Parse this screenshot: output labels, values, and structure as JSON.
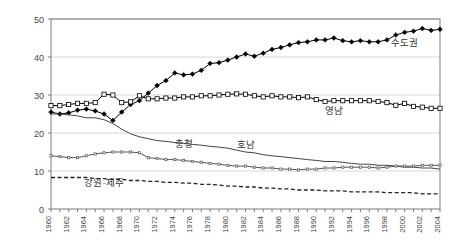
{
  "chart_data": {
    "type": "line",
    "title": "",
    "subtitle": "",
    "xlabel": "",
    "ylabel": "",
    "xlim": [
      1960,
      2004
    ],
    "ylim": [
      0,
      50
    ],
    "yticks": [
      0,
      10,
      20,
      30,
      40,
      50
    ],
    "ytick_labels": [
      "0",
      "10",
      "20",
      "30",
      "40",
      "50"
    ],
    "grid": "horizontal",
    "legend_position": "inline-annotations",
    "x": [
      1960,
      1961,
      1962,
      1963,
      1964,
      1965,
      1966,
      1967,
      1968,
      1969,
      1970,
      1971,
      1972,
      1973,
      1974,
      1975,
      1976,
      1977,
      1978,
      1979,
      1980,
      1981,
      1982,
      1983,
      1984,
      1985,
      1986,
      1987,
      1988,
      1989,
      1990,
      1991,
      1992,
      1993,
      1994,
      1995,
      1996,
      1997,
      1998,
      1999,
      2000,
      2001,
      2002,
      2003,
      2004
    ],
    "xtick_labels": [
      "1960",
      "1962",
      "1964",
      "1966",
      "1968",
      "1970",
      "1972",
      "1974",
      "1976",
      "1978",
      "1980",
      "1982",
      "1984",
      "1986",
      "1988",
      "1990",
      "1992",
      "1994",
      "1996",
      "1998",
      "2000",
      "2002",
      "2004"
    ],
    "series": [
      {
        "name": "수도권",
        "label": "수도권",
        "marker": "filled-diamond",
        "linestyle": "solid",
        "color": "#000000",
        "label_x": 2000,
        "label_y": 43.0,
        "values": [
          25.5,
          25.0,
          25.3,
          26.0,
          26.3,
          25.8,
          25.0,
          23.3,
          25.5,
          27.5,
          28.5,
          30.5,
          32.5,
          33.8,
          35.8,
          35.3,
          35.5,
          36.5,
          38.3,
          38.5,
          39.2,
          40.0,
          40.8,
          40.2,
          41.0,
          42.0,
          42.5,
          43.2,
          43.8,
          44.0,
          44.5,
          44.5,
          45.0,
          44.3,
          44.0,
          44.3,
          44.0,
          44.0,
          44.5,
          45.8,
          46.5,
          46.8,
          47.5,
          47.0,
          47.3
        ]
      },
      {
        "name": "영남",
        "label": "영남",
        "marker": "open-square",
        "linestyle": "solid",
        "color": "#000000",
        "label_x": 1992,
        "label_y": 25.0,
        "values": [
          27.2,
          27.2,
          27.5,
          27.8,
          27.8,
          28.0,
          30.2,
          30.0,
          28.0,
          28.2,
          29.8,
          29.0,
          29.0,
          29.2,
          29.2,
          29.5,
          29.5,
          29.8,
          29.8,
          30.0,
          30.2,
          30.3,
          30.2,
          29.8,
          29.5,
          29.8,
          29.5,
          29.5,
          29.3,
          29.5,
          28.8,
          28.3,
          28.5,
          28.5,
          28.5,
          28.5,
          28.5,
          28.3,
          28.0,
          27.3,
          27.8,
          27.0,
          26.8,
          26.5,
          26.5
        ]
      },
      {
        "name": "호남",
        "label": "호남",
        "marker": "none",
        "linestyle": "solid",
        "color": "#444444",
        "label_x": 1982,
        "label_y": 16.0,
        "values": [
          25.0,
          25.0,
          24.8,
          24.5,
          24.0,
          24.0,
          23.5,
          22.5,
          21.0,
          19.8,
          19.0,
          18.5,
          18.0,
          17.8,
          17.5,
          17.3,
          17.0,
          16.8,
          16.5,
          16.3,
          16.0,
          15.5,
          15.0,
          14.8,
          14.3,
          14.0,
          13.8,
          13.5,
          13.3,
          13.0,
          12.8,
          12.5,
          12.5,
          12.3,
          12.0,
          11.8,
          11.8,
          11.5,
          11.5,
          11.3,
          11.0,
          11.0,
          10.8,
          10.8,
          10.5
        ]
      },
      {
        "name": "충청",
        "label": "충청",
        "marker": "dotted-small",
        "linestyle": "solid",
        "color": "#555555",
        "label_x": 1975,
        "label_y": 16.2,
        "values": [
          14.0,
          13.8,
          13.5,
          13.5,
          14.0,
          14.5,
          14.8,
          15.0,
          15.0,
          15.0,
          14.8,
          13.5,
          13.3,
          13.0,
          13.0,
          12.8,
          12.5,
          12.3,
          12.0,
          11.8,
          11.5,
          11.3,
          11.3,
          11.0,
          10.8,
          10.8,
          10.5,
          10.5,
          10.3,
          10.5,
          10.5,
          10.8,
          10.8,
          11.0,
          11.0,
          11.0,
          11.0,
          10.8,
          11.0,
          11.3,
          11.3,
          11.3,
          11.5,
          11.5,
          11.5
        ]
      },
      {
        "name": "강원·제주",
        "label": "강원·제주",
        "marker": "none",
        "linestyle": "dashed",
        "color": "#222222",
        "label_x": 1966,
        "label_y": 6.0,
        "values": [
          8.3,
          8.3,
          8.3,
          8.3,
          8.3,
          8.0,
          8.0,
          7.8,
          7.8,
          7.5,
          7.5,
          7.3,
          7.3,
          7.0,
          7.0,
          6.8,
          6.8,
          6.5,
          6.5,
          6.3,
          6.0,
          6.0,
          5.8,
          5.8,
          5.5,
          5.5,
          5.3,
          5.3,
          5.0,
          5.0,
          5.0,
          4.8,
          4.8,
          4.8,
          4.5,
          4.5,
          4.5,
          4.5,
          4.3,
          4.3,
          4.3,
          4.3,
          4.0,
          4.0,
          4.0
        ]
      }
    ]
  },
  "colors": {
    "axis": "#7a7a7a",
    "grid": "#d8d8d8",
    "background": "#ffffff",
    "text": "#444444"
  }
}
